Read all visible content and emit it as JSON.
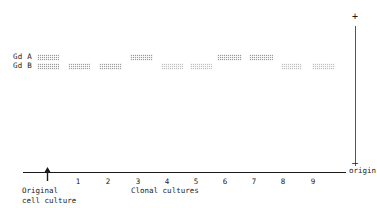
{
  "figure": {
    "type": "electrophoresis-gel-diagram",
    "row_labels": [
      {
        "id": "gd-a",
        "text": "Gd A"
      },
      {
        "id": "gd-b",
        "text": "Gd B"
      }
    ],
    "axis": {
      "x_axis_caption": "Clonal  cultures",
      "origin_label": "origin",
      "plus_sign": "+",
      "minus_sign": "—",
      "tick_labels": [
        "1",
        "2",
        "3",
        "4",
        "5",
        "6",
        "7",
        "8",
        "9"
      ]
    },
    "original_marker": {
      "caption_line1": "Original",
      "caption_line2": "cell culture",
      "icon": "up-arrow-icon"
    },
    "colors": {
      "band": "#9a9a9a",
      "axis": "#1a1a1a",
      "text": "#1a1a1a"
    }
  },
  "chart_data": {
    "type": "table",
    "xlabel": "Clonal  cultures",
    "ylabel": "",
    "categories": [
      "Original cell culture",
      "1",
      "2",
      "3",
      "4",
      "5",
      "6",
      "7",
      "8",
      "9"
    ],
    "series": [
      {
        "name": "Gd A",
        "values": [
          1,
          0,
          0,
          1,
          0,
          0,
          1,
          1,
          0,
          0
        ]
      },
      {
        "name": "Gd B",
        "values": [
          1,
          1,
          1,
          0,
          1,
          1,
          0,
          0,
          1,
          1
        ]
      }
    ],
    "legend": [
      "Gd A",
      "Gd B"
    ],
    "grid": false
  },
  "lanes": [
    {
      "name": "original-cell-culture",
      "x": 37,
      "w": 22,
      "gd_a": true,
      "gd_b": true,
      "a_style": "strong",
      "b_style": "strong"
    },
    {
      "name": "lane-1",
      "x": 68,
      "w": 22,
      "gd_a": false,
      "gd_b": true,
      "a_style": "",
      "b_style": ""
    },
    {
      "name": "lane-2",
      "x": 99,
      "w": 23,
      "gd_a": false,
      "gd_b": true,
      "a_style": "",
      "b_style": ""
    },
    {
      "name": "lane-3",
      "x": 130,
      "w": 23,
      "gd_a": true,
      "gd_b": false,
      "a_style": "strong",
      "b_style": ""
    },
    {
      "name": "lane-4",
      "x": 161,
      "w": 22,
      "gd_a": false,
      "gd_b": true,
      "a_style": "",
      "b_style": "faint"
    },
    {
      "name": "lane-5",
      "x": 190,
      "w": 22,
      "gd_a": false,
      "gd_b": true,
      "a_style": "",
      "b_style": "faint"
    },
    {
      "name": "lane-6",
      "x": 217,
      "w": 25,
      "gd_a": true,
      "gd_b": false,
      "a_style": "strong",
      "b_style": ""
    },
    {
      "name": "lane-7",
      "x": 249,
      "w": 24,
      "gd_a": true,
      "gd_b": false,
      "a_style": "strong",
      "b_style": ""
    },
    {
      "name": "lane-8",
      "x": 281,
      "w": 21,
      "gd_a": false,
      "gd_b": true,
      "a_style": "",
      "b_style": "faint"
    },
    {
      "name": "lane-9",
      "x": 312,
      "w": 23,
      "gd_a": false,
      "gd_b": true,
      "a_style": "",
      "b_style": "faint"
    }
  ],
  "tick_positions": [
    78,
    108,
    138,
    167,
    196,
    225,
    254,
    283,
    313
  ]
}
